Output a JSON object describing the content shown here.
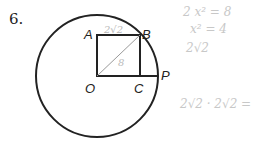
{
  "problem": {
    "number": "6."
  },
  "diagram": {
    "labels": {
      "A": "A",
      "B": "B",
      "O": "O",
      "C": "C",
      "P": "P"
    },
    "annotations": {
      "side_AB": "2√2",
      "diagonal_OB": "8"
    },
    "colors": {
      "ink": "#222222",
      "pencil": "#c8c8c8"
    }
  },
  "handwritten_notes": [
    "2 x² = 8",
    "x² = 4",
    "2√2",
    "2√2 · 2√2 ="
  ]
}
